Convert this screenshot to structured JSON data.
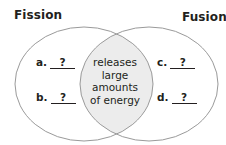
{
  "diagram": {
    "type": "venn",
    "left_set": {
      "title": "Fission",
      "items": [
        {
          "letter": "a.",
          "value": "?"
        },
        {
          "letter": "b.",
          "value": "?"
        }
      ]
    },
    "right_set": {
      "title": "Fusion",
      "items": [
        {
          "letter": "c.",
          "value": "?"
        },
        {
          "letter": "d.",
          "value": "?"
        }
      ]
    },
    "intersection": {
      "lines": [
        "releases",
        "large",
        "amounts",
        "of energy"
      ]
    },
    "colors": {
      "outline": "#9a9a9a",
      "intersection_fill": "#ececec",
      "text": "#231f20"
    }
  }
}
